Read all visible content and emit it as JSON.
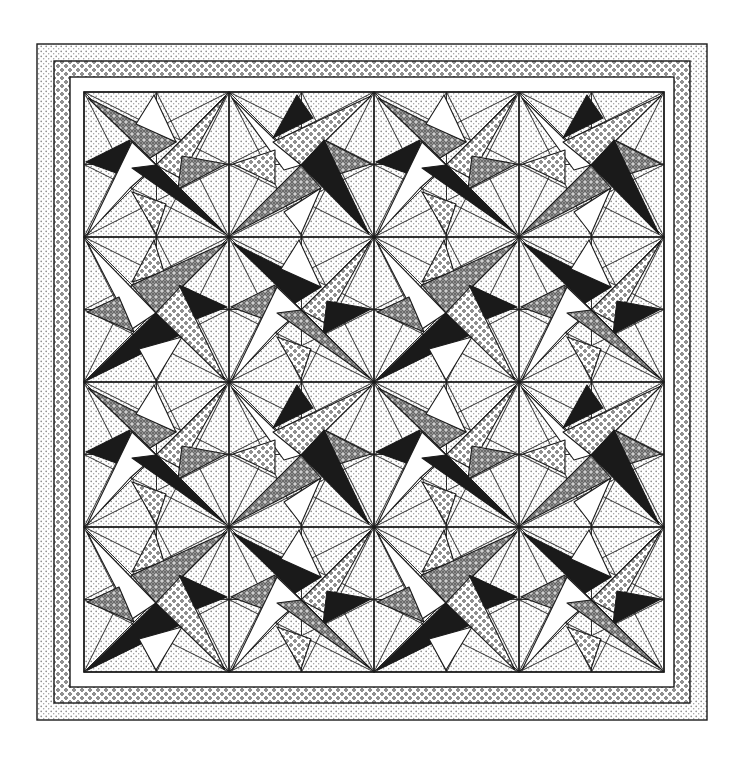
{
  "image": {
    "subject": "Quilt illustration — 4x4 star pinwheel blocks with triple border",
    "width": 742,
    "height": 758
  },
  "colors": {
    "ink": "#1a1a1a",
    "paper": "#ffffff",
    "dot_gray": "#8a8a8a",
    "circle_ink": "#333333"
  },
  "frame": {
    "outer": {
      "x": 37,
      "y": 44,
      "w": 670,
      "h": 676,
      "fill": "finedot"
    },
    "middle": {
      "x": 54,
      "y": 61,
      "w": 636,
      "h": 642,
      "fill": "circles"
    },
    "inner": {
      "x": 70,
      "y": 77,
      "w": 604,
      "h": 610,
      "fill": "white"
    }
  },
  "quilt": {
    "x": 84,
    "y": 92,
    "cols": 4,
    "rows": 4,
    "block": 145,
    "layout": [
      [
        "A",
        "B",
        "A",
        "B"
      ],
      [
        "C",
        "D",
        "C",
        "D"
      ],
      [
        "A",
        "B",
        "A",
        "B"
      ],
      [
        "C",
        "D",
        "C",
        "D"
      ]
    ]
  },
  "motifs": {
    "A": [
      {
        "fill": "swirl",
        "pts": [
          [
            4,
            6
          ],
          [
            92,
            50
          ],
          [
            66,
            66
          ]
        ]
      },
      {
        "fill": "white",
        "pts": [
          [
            70,
            3
          ],
          [
            52,
            32
          ],
          [
            92,
            50
          ]
        ]
      },
      {
        "fill": "black",
        "pts": [
          [
            2,
            70
          ],
          [
            46,
            48
          ],
          [
            46,
            86
          ]
        ]
      },
      {
        "fill": "white",
        "pts": [
          [
            48,
            50
          ],
          [
            3,
            143
          ],
          [
            46,
            96
          ],
          [
            72,
            73
          ]
        ]
      },
      {
        "fill": "circles",
        "pts": [
          [
            142,
            4
          ],
          [
            72,
            73
          ],
          [
            96,
            86
          ]
        ]
      },
      {
        "fill": "swirl",
        "pts": [
          [
            98,
            64
          ],
          [
            142,
            72
          ],
          [
            94,
            97
          ]
        ]
      },
      {
        "fill": "black",
        "pts": [
          [
            48,
            76
          ],
          [
            72,
            73
          ],
          [
            142,
            142
          ]
        ]
      },
      {
        "fill": "circles",
        "pts": [
          [
            48,
            100
          ],
          [
            82,
            112
          ],
          [
            72,
            142
          ]
        ]
      }
    ],
    "B": [
      {
        "fill": "white",
        "pts": [
          [
            3,
            6
          ],
          [
            72,
            73
          ],
          [
            55,
            78
          ]
        ]
      },
      {
        "fill": "black",
        "pts": [
          [
            68,
            3
          ],
          [
            44,
            46
          ],
          [
            84,
            26
          ]
        ]
      },
      {
        "fill": "circles",
        "pts": [
          [
            142,
            4
          ],
          [
            44,
            50
          ],
          [
            72,
            73
          ]
        ]
      },
      {
        "fill": "swirl",
        "pts": [
          [
            95,
            48
          ],
          [
            142,
            72
          ],
          [
            110,
            82
          ]
        ]
      },
      {
        "fill": "black",
        "pts": [
          [
            72,
            73
          ],
          [
            95,
            48
          ],
          [
            140,
            142
          ]
        ]
      },
      {
        "fill": "swirl",
        "pts": [
          [
            3,
            142
          ],
          [
            72,
            73
          ],
          [
            92,
            96
          ]
        ]
      },
      {
        "fill": "white",
        "pts": [
          [
            55,
            120
          ],
          [
            92,
            96
          ],
          [
            72,
            142
          ]
        ]
      },
      {
        "fill": "circles",
        "pts": [
          [
            4,
            72
          ],
          [
            46,
            58
          ],
          [
            46,
            92
          ]
        ]
      }
    ],
    "C": [
      {
        "fill": "white",
        "pts": [
          [
            3,
            5
          ],
          [
            72,
            76
          ],
          [
            48,
            92
          ]
        ]
      },
      {
        "fill": "swirl",
        "pts": [
          [
            3,
            75
          ],
          [
            35,
            60
          ],
          [
            50,
            95
          ]
        ]
      },
      {
        "fill": "black",
        "pts": [
          [
            3,
            143
          ],
          [
            72,
            76
          ],
          [
            96,
            98
          ]
        ]
      },
      {
        "fill": "circles",
        "pts": [
          [
            70,
            3
          ],
          [
            48,
            45
          ],
          [
            80,
            35
          ]
        ]
      },
      {
        "fill": "swirl",
        "pts": [
          [
            143,
            5
          ],
          [
            48,
            48
          ],
          [
            72,
            76
          ]
        ]
      },
      {
        "fill": "black",
        "pts": [
          [
            95,
            48
          ],
          [
            143,
            70
          ],
          [
            102,
            86
          ]
        ]
      },
      {
        "fill": "circles",
        "pts": [
          [
            72,
            76
          ],
          [
            96,
            50
          ],
          [
            141,
            143
          ]
        ]
      },
      {
        "fill": "white",
        "pts": [
          [
            55,
            112
          ],
          [
            98,
            100
          ],
          [
            72,
            143
          ]
        ]
      }
    ],
    "D": [
      {
        "fill": "black",
        "pts": [
          [
            4,
            6
          ],
          [
            92,
            50
          ],
          [
            66,
            66
          ]
        ]
      },
      {
        "fill": "white",
        "pts": [
          [
            70,
            3
          ],
          [
            52,
            32
          ],
          [
            92,
            50
          ]
        ]
      },
      {
        "fill": "swirl",
        "pts": [
          [
            2,
            70
          ],
          [
            46,
            48
          ],
          [
            46,
            86
          ]
        ]
      },
      {
        "fill": "white",
        "pts": [
          [
            48,
            50
          ],
          [
            3,
            143
          ],
          [
            46,
            96
          ],
          [
            72,
            73
          ]
        ]
      },
      {
        "fill": "circles",
        "pts": [
          [
            142,
            4
          ],
          [
            72,
            73
          ],
          [
            96,
            86
          ]
        ]
      },
      {
        "fill": "black",
        "pts": [
          [
            98,
            64
          ],
          [
            142,
            72
          ],
          [
            94,
            97
          ]
        ]
      },
      {
        "fill": "swirl",
        "pts": [
          [
            48,
            76
          ],
          [
            72,
            73
          ],
          [
            142,
            142
          ]
        ]
      },
      {
        "fill": "circles",
        "pts": [
          [
            48,
            100
          ],
          [
            82,
            112
          ],
          [
            72,
            142
          ]
        ]
      }
    ]
  },
  "guide_lines": [
    [
      0,
      0,
      145,
      145
    ],
    [
      145,
      0,
      0,
      145
    ],
    [
      72.5,
      0,
      72.5,
      145
    ],
    [
      0,
      72.5,
      145,
      72.5
    ],
    [
      0,
      0,
      72.5,
      145
    ],
    [
      0,
      0,
      145,
      72.5
    ],
    [
      145,
      0,
      72.5,
      145
    ],
    [
      145,
      0,
      0,
      72.5
    ],
    [
      0,
      145,
      72.5,
      0
    ],
    [
      0,
      145,
      145,
      72.5
    ],
    [
      145,
      145,
      72.5,
      0
    ],
    [
      145,
      145,
      0,
      72.5
    ]
  ]
}
